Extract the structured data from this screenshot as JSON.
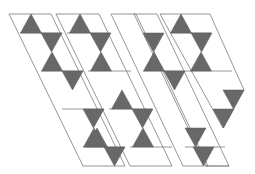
{
  "figure": {
    "colors": {
      "background": "#ffffff",
      "outline": "#8a8a8a",
      "shade": "#686868"
    },
    "lattice": {
      "x0": 9,
      "y0": 14,
      "side": 21.3,
      "row_height": 19
    },
    "strips": [
      {
        "name": "strip-1",
        "outline": [
          [
            0,
            0
          ],
          [
            2,
            0
          ],
          [
            2,
            8
          ],
          [
            0,
            8
          ]
        ],
        "rungs": [
          1,
          3,
          4,
          7
        ],
        "shaded": [
          [
            1,
            0,
            "up"
          ],
          [
            1,
            1,
            "down"
          ],
          [
            1,
            2,
            "up"
          ],
          [
            1,
            3,
            "down"
          ],
          [
            1,
            5,
            "up"
          ],
          [
            0,
            6,
            "up"
          ],
          [
            1,
            7,
            "down"
          ]
        ]
      },
      {
        "name": "strip-2",
        "outline": [
          [
            7,
            0
          ],
          [
            9,
            0
          ],
          [
            9,
            8
          ],
          [
            7,
            8
          ]
        ],
        "rungs": [
          1,
          3,
          5,
          7
        ],
        "shaded": [
          [
            7.5,
            0,
            "up"
          ],
          [
            8,
            1,
            "down"
          ],
          [
            7.5,
            2,
            "up"
          ],
          [
            6,
            5,
            "up"
          ],
          [
            6,
            6,
            "down"
          ],
          [
            5.5,
            7,
            "up"
          ]
        ]
      },
      {
        "name": "strip-3",
        "outline": [
          [
            15,
            0
          ],
          [
            18,
            0
          ],
          [
            18,
            8
          ],
          [
            15,
            8
          ]
        ],
        "rungs": [
          3,
          7
        ],
        "shaded": [
          [
            16,
            1,
            "down"
          ],
          [
            16,
            2,
            "up"
          ],
          [
            16,
            3,
            "down"
          ],
          [
            13.5,
            7,
            "down"
          ],
          [
            13.5,
            8,
            "down"
          ]
        ]
      },
      {
        "name": "strip-4",
        "outline": [
          [
            22,
            0
          ],
          [
            24,
            0
          ],
          [
            24,
            6
          ],
          [
            22,
            6
          ]
        ],
        "rungs": [
          1,
          3,
          5
        ],
        "shaded": [
          [
            22.5,
            0,
            "up"
          ],
          [
            22.5,
            1,
            "down"
          ],
          [
            22,
            2,
            "up"
          ],
          [
            20.5,
            5,
            "down"
          ],
          [
            20.5,
            6,
            "down"
          ]
        ]
      }
    ]
  }
}
